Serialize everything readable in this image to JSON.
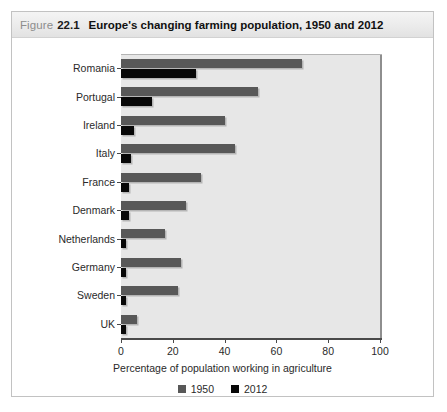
{
  "figure": {
    "label_word": "Figure",
    "number": "22.1",
    "title": "Europe's changing farming population, 1950 and 2012"
  },
  "legend": {
    "items": [
      {
        "label": "1950",
        "color": "#585858",
        "swatch_name": "legend-swatch-1950"
      },
      {
        "label": "2012",
        "color": "#080808",
        "swatch_name": "legend-swatch-2012"
      }
    ]
  },
  "chart_data": {
    "type": "bar",
    "orientation": "horizontal",
    "title": "Europe's changing farming population, 1950 and 2012",
    "xlabel": "Percentage of population working in agriculture",
    "ylabel": "",
    "xlim": [
      0,
      100
    ],
    "xticks": [
      0,
      20,
      40,
      60,
      80,
      100
    ],
    "xtick_labels": [
      "0",
      "20",
      "40",
      "60",
      "80",
      "100"
    ],
    "grid": false,
    "legend_position": "bottom-center",
    "categories": [
      "Romania",
      "Portugal",
      "Ireland",
      "Italy",
      "France",
      "Denmark",
      "Netherlands",
      "Germany",
      "Sweden",
      "UK"
    ],
    "series": [
      {
        "name": "1950",
        "color": "#585858",
        "values": [
          70,
          53,
          40,
          44,
          31,
          25,
          17,
          23,
          22,
          6
        ]
      },
      {
        "name": "2012",
        "color": "#080808",
        "values": [
          29,
          12,
          5,
          4,
          3,
          3,
          2,
          2,
          2,
          2
        ]
      }
    ]
  }
}
